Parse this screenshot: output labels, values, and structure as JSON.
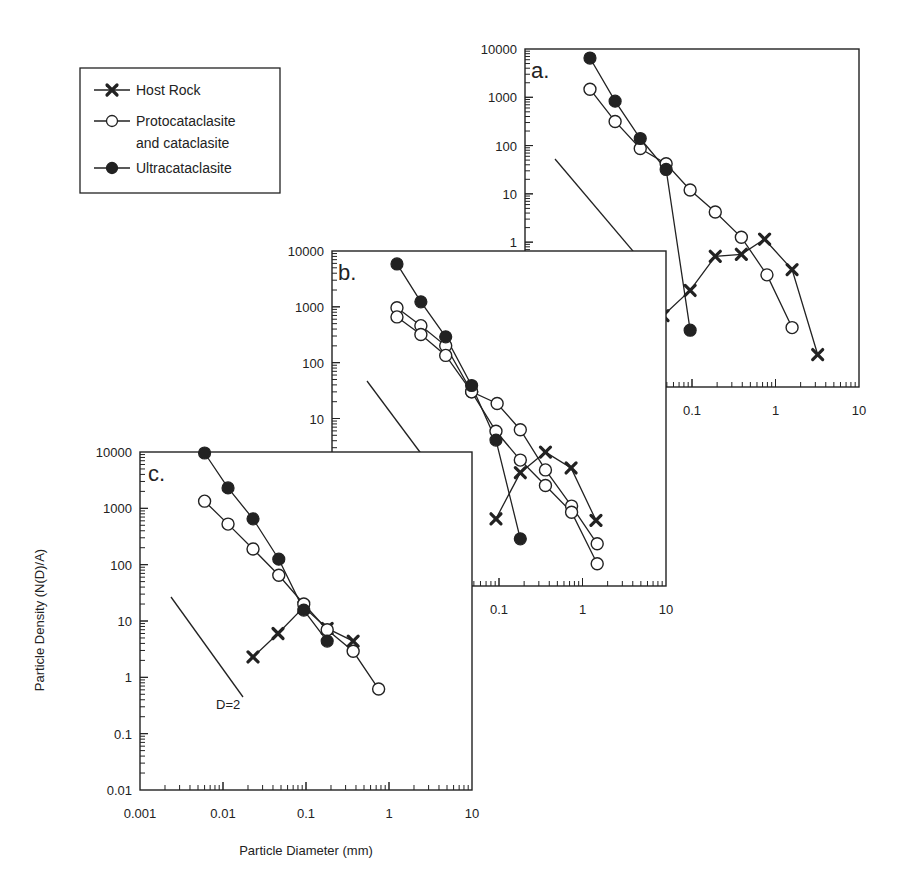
{
  "chart_data": {
    "type": "scatter",
    "scale": "log-log",
    "xlabel": "Particle Diameter (mm)",
    "ylabel": "Particle Density (N(D)/A)",
    "legend": {
      "placement": "top-left",
      "entries": [
        {
          "key": "host",
          "label": "Host Rock",
          "marker": "x-cross"
        },
        {
          "key": "proto",
          "label": "Protocataclasite and cataclasite",
          "label_lines": [
            "Protocataclasite",
            "and cataclasite"
          ],
          "marker": "open-circle"
        },
        {
          "key": "ultra",
          "label": "Ultracataclasite",
          "marker": "filled-circle"
        }
      ]
    },
    "panels": [
      {
        "id": "a",
        "label": "a.",
        "xlim": [
          0.001,
          10
        ],
        "ylim": [
          0.001,
          10000
        ],
        "x_tick_labels": [
          "0.1",
          "1",
          "10"
        ],
        "x_tick_values": [
          0.1,
          1,
          10
        ],
        "y_tick_labels": [
          "10000",
          "1000",
          "100",
          "10",
          "1"
        ],
        "y_tick_values": [
          10000,
          1000,
          100,
          10,
          1
        ],
        "reference_line": {
          "label": "D=2",
          "slope": -2
        },
        "series": [
          {
            "name": "Ultracataclasite",
            "key": "ultra",
            "x": [
              0.006,
              0.012,
              0.024,
              0.049,
              0.095
            ],
            "y": [
              6500,
              830,
              140,
              32,
              0.015
            ]
          },
          {
            "name": "Protocataclasite and cataclasite",
            "key": "proto",
            "x": [
              0.006,
              0.012,
              0.024,
              0.049,
              0.095,
              0.19,
              0.39,
              0.79,
              1.58
            ],
            "y": [
              1470,
              316,
              87,
              42,
              12,
              4.2,
              1.26,
              0.21,
              0.017
            ]
          },
          {
            "name": "Host Rock",
            "key": "host",
            "x": [
              0.045,
              0.095,
              0.19,
              0.39,
              0.74,
              1.58,
              3.2
            ],
            "y": [
              0.03,
              0.1,
              0.51,
              0.56,
              1.15,
              0.27,
              0.0047
            ]
          }
        ]
      },
      {
        "id": "b",
        "label": "b.",
        "xlim": [
          0.001,
          10
        ],
        "ylim": [
          0.01,
          10000
        ],
        "x_tick_labels": [
          "0.1",
          "1",
          "10"
        ],
        "x_tick_values": [
          0.1,
          1,
          10
        ],
        "y_tick_labels": [
          "10000",
          "1000",
          "100",
          "10"
        ],
        "y_tick_values": [
          10000,
          1000,
          100,
          10
        ],
        "reference_line": {
          "label": "D=2",
          "slope": -2
        },
        "series": [
          {
            "name": "Ultracataclasite",
            "key": "ultra",
            "x": [
              0.006,
              0.0116,
              0.023,
              0.047,
              0.092,
              0.18
            ],
            "y": [
              5860,
              1230,
              290,
              39,
              4.1,
              0.07
            ]
          },
          {
            "name": "Protocataclasite and cataclasite (1)",
            "key": "proto",
            "x": [
              0.006,
              0.0116,
              0.023,
              0.047,
              0.095,
              0.18,
              0.36,
              0.74,
              1.5
            ],
            "y": [
              960,
              460,
              200,
              30,
              18.6,
              6.3,
              1.2,
              0.27,
              0.057
            ]
          },
          {
            "name": "Protocataclasite and cataclasite (2)",
            "key": "proto",
            "x": [
              0.006,
              0.0116,
              0.023,
              0.047,
              0.092,
              0.18,
              0.36,
              0.74,
              1.5
            ],
            "y": [
              660,
              320,
              135,
              30,
              5.9,
              1.8,
              0.63,
              0.21,
              0.025
            ]
          },
          {
            "name": "Host Rock",
            "key": "host",
            "x": [
              0.092,
              0.18,
              0.36,
              0.73,
              1.45
            ],
            "y": [
              0.16,
              1.07,
              2.5,
              1.3,
              0.15
            ]
          }
        ]
      },
      {
        "id": "c",
        "label": "c.",
        "xlim": [
          0.001,
          10
        ],
        "ylim": [
          0.01,
          10000
        ],
        "x_tick_labels": [
          "0.001",
          "0.01",
          "0.1",
          "1",
          "10"
        ],
        "x_tick_values": [
          0.001,
          0.01,
          0.1,
          1,
          10
        ],
        "y_tick_labels": [
          "10000",
          "1000",
          "100",
          "10",
          "1",
          "0.1",
          "0.01"
        ],
        "y_tick_values": [
          10000,
          1000,
          100,
          10,
          1,
          0.1,
          0.01
        ],
        "reference_line": {
          "label": "D=2",
          "slope": -2
        },
        "series": [
          {
            "name": "Ultracataclasite",
            "key": "ultra",
            "x": [
              0.006,
              0.0115,
              0.023,
              0.047,
              0.094,
              0.18
            ],
            "y": [
              9600,
              2300,
              650,
              125,
              15.6,
              4.4
            ]
          },
          {
            "name": "Protocataclasite and cataclasite",
            "key": "proto",
            "x": [
              0.006,
              0.0115,
              0.023,
              0.047,
              0.094,
              0.18,
              0.37,
              0.75
            ],
            "y": [
              1340,
              525,
              190,
              65,
              20,
              7,
              2.9,
              0.62
            ]
          },
          {
            "name": "Host Rock",
            "key": "host",
            "x": [
              0.023,
              0.046,
              0.094,
              0.18,
              0.37
            ],
            "y": [
              2.3,
              6,
              17.7,
              7.4,
              4.4
            ]
          }
        ]
      }
    ]
  }
}
